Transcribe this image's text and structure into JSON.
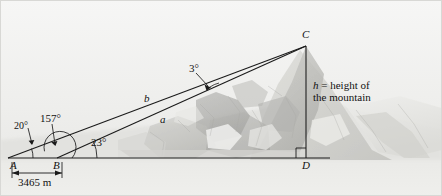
{
  "figure": {
    "background_description": "photograph of a gray rocky mountain",
    "line_color": "#1a1a1a",
    "page_color": "#f2f2f0"
  },
  "points": {
    "a_label": "A",
    "b_label": "B",
    "c_label": "C",
    "d_label": "D"
  },
  "angles": {
    "at_a": "20°",
    "at_b_exterior": "157°",
    "at_b_interior": "23°",
    "at_c": "3°"
  },
  "sides": {
    "b_side": "b",
    "a_side": "a"
  },
  "dimension": {
    "baseline_length": "3465 m"
  },
  "annotation": {
    "height_line1": "h = height of",
    "height_line2": "the mountain",
    "height_symbol": "h",
    "height_rest": " = height of"
  }
}
